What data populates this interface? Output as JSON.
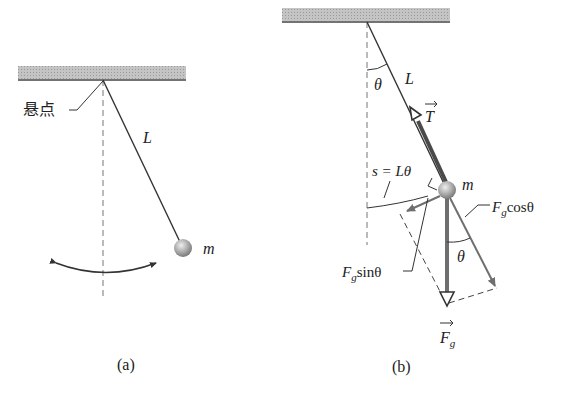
{
  "figure_a": {
    "caption": "(a)",
    "pivot_label": "悬点",
    "length_label": "L",
    "mass_label": "m"
  },
  "figure_b": {
    "caption": "(b)",
    "angle_label": "θ",
    "length_label": "L",
    "tension_label": "T",
    "arc_label": "s = Lθ",
    "mass_label": "m",
    "fg_cos_label_main": "F",
    "fg_cos_label_sub": "g",
    "fg_cos_label_tail": "cosθ",
    "fg_sin_label_main": "F",
    "fg_sin_label_sub": "g",
    "fg_sin_label_tail": "sinθ",
    "angle2_label": "θ",
    "gravity_label_main": "F",
    "gravity_label_sub": "g"
  },
  "colors": {
    "ceiling": "#b8b8b8",
    "line": "#333333",
    "force": "#6f6f6f",
    "ball": "#a8a8a8"
  }
}
